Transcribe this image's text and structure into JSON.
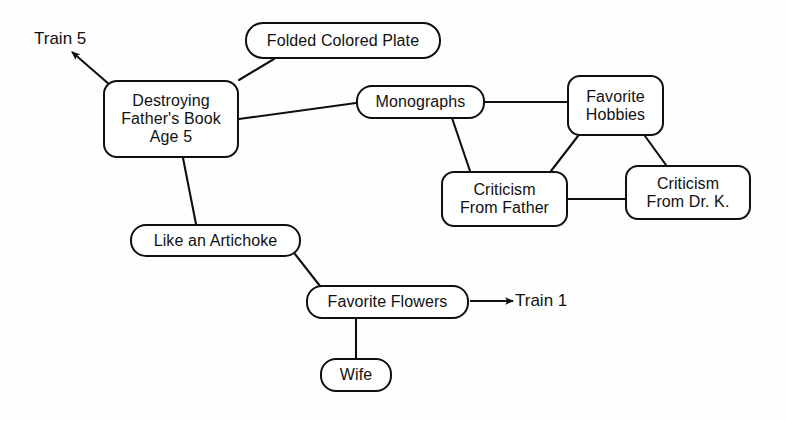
{
  "diagram": {
    "nodes": [
      {
        "id": "destroying-fathers-book",
        "label": "Destroying\nFather's Book\nAge 5",
        "x": 103,
        "y": 80,
        "w": 136,
        "h": 78,
        "radius": 14,
        "font_size": 16
      },
      {
        "id": "folded-colored-plate",
        "label": "Folded Colored Plate",
        "x": 245,
        "y": 22,
        "w": 196,
        "h": 37,
        "radius": 18,
        "font_size": 16
      },
      {
        "id": "monographs",
        "label": "Monographs",
        "x": 356,
        "y": 85,
        "w": 129,
        "h": 34,
        "radius": 16,
        "font_size": 16
      },
      {
        "id": "favorite-hobbies",
        "label": "Favorite\nHobbies",
        "x": 567,
        "y": 75,
        "w": 97,
        "h": 61,
        "radius": 13,
        "font_size": 16
      },
      {
        "id": "criticism-from-father",
        "label": "Criticism\nFrom Father",
        "x": 441,
        "y": 171,
        "w": 127,
        "h": 56,
        "radius": 13,
        "font_size": 16
      },
      {
        "id": "criticism-from-dr-k",
        "label": "Criticism\nFrom Dr. K.",
        "x": 625,
        "y": 165,
        "w": 126,
        "h": 55,
        "radius": 13,
        "font_size": 16
      },
      {
        "id": "like-an-artichoke",
        "label": "Like an Artichoke",
        "x": 130,
        "y": 224,
        "w": 171,
        "h": 33,
        "radius": 16,
        "font_size": 16
      },
      {
        "id": "favorite-flowers",
        "label": "Favorite Flowers",
        "x": 306,
        "y": 285,
        "w": 163,
        "h": 34,
        "radius": 16,
        "font_size": 16
      },
      {
        "id": "wife",
        "label": "Wife",
        "x": 320,
        "y": 358,
        "w": 72,
        "h": 34,
        "radius": 16,
        "font_size": 16
      }
    ],
    "edges": [
      {
        "id": "edge-destroying-to-folded-plate",
        "from": "destroying-fathers-book",
        "to": "folded-colored-plate",
        "x1": 239,
        "y1": 80,
        "x2": 274,
        "y2": 59
      },
      {
        "id": "edge-destroying-to-monographs",
        "from": "destroying-fathers-book",
        "to": "monographs",
        "x1": 239,
        "y1": 119,
        "x2": 356,
        "y2": 103
      },
      {
        "id": "edge-destroying-to-artichoke",
        "from": "destroying-fathers-book",
        "to": "like-an-artichoke",
        "x1": 183,
        "y1": 158,
        "x2": 196,
        "y2": 224
      },
      {
        "id": "edge-monographs-to-hobbies",
        "from": "monographs",
        "to": "favorite-hobbies",
        "x1": 485,
        "y1": 102,
        "x2": 567,
        "y2": 102
      },
      {
        "id": "edge-monographs-to-criticism-father",
        "from": "monographs",
        "to": "criticism-from-father",
        "x1": 452,
        "y1": 118,
        "x2": 470,
        "y2": 171
      },
      {
        "id": "edge-hobbies-to-criticism-father",
        "from": "favorite-hobbies",
        "to": "criticism-from-father",
        "x1": 578,
        "y1": 136,
        "x2": 551,
        "y2": 171
      },
      {
        "id": "edge-hobbies-to-criticism-drk",
        "from": "favorite-hobbies",
        "to": "criticism-from-dr-k",
        "x1": 645,
        "y1": 136,
        "x2": 666,
        "y2": 165
      },
      {
        "id": "edge-criticism-father-to-criticism-drk",
        "from": "criticism-from-father",
        "to": "criticism-from-dr-k",
        "x1": 568,
        "y1": 199,
        "x2": 625,
        "y2": 199
      },
      {
        "id": "edge-artichoke-to-flowers",
        "from": "like-an-artichoke",
        "to": "favorite-flowers",
        "x1": 295,
        "y1": 254,
        "x2": 320,
        "y2": 286
      },
      {
        "id": "edge-flowers-to-wife",
        "from": "favorite-flowers",
        "to": "wife",
        "x1": 356,
        "y1": 319,
        "x2": 356,
        "y2": 358
      }
    ],
    "arrows": [
      {
        "id": "arrow-train-5",
        "label": "Train 5",
        "from_node": "destroying-fathers-book",
        "x1": 110,
        "y1": 85,
        "x2": 72,
        "y2": 52,
        "label_x": 34,
        "label_y": 29,
        "font_size": 17
      },
      {
        "id": "arrow-train-1",
        "label": "Train 1",
        "from_node": "favorite-flowers",
        "x1": 470,
        "y1": 301,
        "x2": 513,
        "y2": 301,
        "label_x": 515,
        "label_y": 291,
        "font_size": 17
      }
    ],
    "colors": {
      "stroke": "#101010",
      "text": "#111111",
      "background": "#fefefe"
    }
  }
}
